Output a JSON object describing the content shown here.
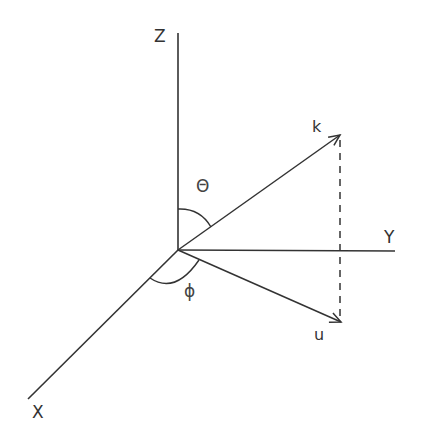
{
  "diagram": {
    "type": "3d-coordinate-system",
    "axes": {
      "z": {
        "label": "Z"
      },
      "y": {
        "label": "Y"
      },
      "x": {
        "label": "X"
      }
    },
    "vectors": {
      "k": {
        "label": "k"
      },
      "u": {
        "label": "u"
      }
    },
    "angles": {
      "theta": {
        "label": "Θ"
      },
      "phi": {
        "label": "ϕ"
      }
    },
    "colors": {
      "line": "#333333",
      "background": "#ffffff"
    }
  }
}
